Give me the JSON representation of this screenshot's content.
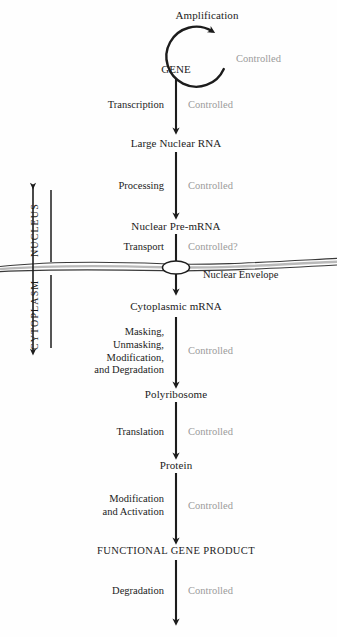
{
  "diagram": {
    "background_color": "#fefefe",
    "ink_color": "#1c1c1c",
    "control_color": "#9b9b9b"
  },
  "loop": {
    "label": "Amplification",
    "control": "Controlled"
  },
  "nodes": [
    {
      "id": "gene",
      "label": "GENE"
    },
    {
      "id": "large-nuclear-rna",
      "label": "Large Nuclear RNA"
    },
    {
      "id": "nuclear-pre-mrna",
      "label": "Nuclear Pre-mRNA"
    },
    {
      "id": "cytoplasmic-mrna",
      "label": "Cytoplasmic mRNA"
    },
    {
      "id": "polyribosome",
      "label": "Polyribosome"
    },
    {
      "id": "protein",
      "label": "Protein"
    },
    {
      "id": "functional-gene-product",
      "label": "FUNCTIONAL GENE PRODUCT"
    }
  ],
  "steps": [
    {
      "id": "transcription",
      "process": "Transcription",
      "control": "Controlled"
    },
    {
      "id": "processing",
      "process": "Processing",
      "control": "Controlled"
    },
    {
      "id": "transport",
      "process": "Transport",
      "control": "Controlled?"
    },
    {
      "id": "masking",
      "process_lines": [
        "Masking,",
        "Unmasking,",
        "Modification,",
        "and Degradation"
      ],
      "control": "Controlled"
    },
    {
      "id": "translation",
      "process": "Translation",
      "control": "Controlled"
    },
    {
      "id": "modification",
      "process_lines": [
        "Modification",
        "and Activation"
      ],
      "control": "Controlled"
    },
    {
      "id": "degradation",
      "process": "Degradation",
      "control": "Controlled"
    }
  ],
  "compartments": {
    "nucleus": "NUCLEUS",
    "cytoplasm": "CYTOPLASM"
  },
  "membrane": {
    "label": "Nuclear Envelope",
    "pore": "nuclear-pore"
  }
}
